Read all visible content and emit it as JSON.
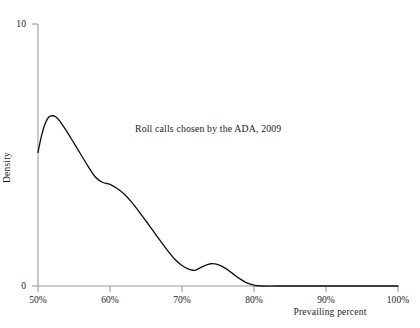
{
  "chart_data": {
    "type": "line",
    "title": "",
    "subtitle": "",
    "xlabel": "Prevailing percent",
    "ylabel": "Density",
    "xlim": [
      50,
      100
    ],
    "ylim": [
      0,
      10
    ],
    "grid": false,
    "legend": null,
    "annotations": [
      {
        "text": "Roll calls chosen by the ADA, 2009",
        "x": 63.5,
        "y": 6.2
      }
    ],
    "xticks": [
      50,
      60,
      70,
      80,
      90,
      100
    ],
    "xticklabels": [
      "50%",
      "60%",
      "70%",
      "80%",
      "90%",
      "100%"
    ],
    "yticks": [
      0,
      10
    ],
    "yticklabels": [
      "0",
      "10"
    ],
    "series": [
      {
        "name": "Density of prevailing percent",
        "color": "#111111",
        "x": [
          50.0,
          50.5,
          51.0,
          51.5,
          52.0,
          52.5,
          53.0,
          54.0,
          55.0,
          56.0,
          57.0,
          58.0,
          59.0,
          60.0,
          61.0,
          62.0,
          63.0,
          64.0,
          65.0,
          66.0,
          67.0,
          68.0,
          69.0,
          70.0,
          71.0,
          71.5,
          72.0,
          73.0,
          74.0,
          75.0,
          76.0,
          77.0,
          78.0,
          79.0,
          80.0,
          81.0,
          85.0,
          90.0,
          95.0,
          100.0
        ],
        "y": [
          5.1,
          5.75,
          6.2,
          6.45,
          6.5,
          6.45,
          6.3,
          5.9,
          5.45,
          5.0,
          4.55,
          4.15,
          3.95,
          3.88,
          3.72,
          3.5,
          3.2,
          2.85,
          2.48,
          2.1,
          1.72,
          1.35,
          1.02,
          0.78,
          0.63,
          0.6,
          0.62,
          0.76,
          0.85,
          0.82,
          0.68,
          0.48,
          0.28,
          0.12,
          0.03,
          0.0,
          0.0,
          0.0,
          0.0,
          0.0
        ]
      }
    ]
  },
  "axis_style": {
    "axis_color": "#9a9a9a",
    "curve_color": "#111111"
  }
}
